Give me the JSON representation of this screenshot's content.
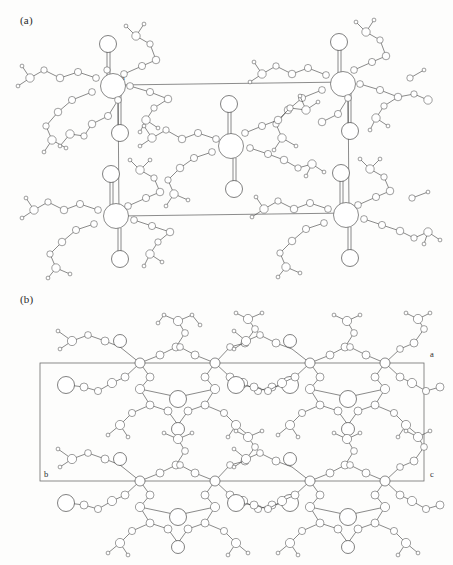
{
  "figure": {
    "type": "crystal-structure-packing-diagram",
    "background_color": "#fdfdfc",
    "line_color": "#2b2b2b",
    "cell_edge_color": "#6e6e6e",
    "atom_fill_color": "#ffffff"
  },
  "panels": [
    {
      "id": "a",
      "label": "(a)",
      "view_description": "Unit cell packing projection showing metal-centred coordination clusters with peripheral ligand groups",
      "unit_cell": {
        "shape": "parallelogram",
        "axis_labels": [
          {
            "name": "a",
            "text": "a",
            "corner": "top-left"
          },
          {
            "name": "b",
            "text": "b",
            "corner": "bottom-left"
          },
          {
            "name": "c",
            "text": "c",
            "corner": "bottom-right"
          }
        ]
      },
      "molecule_count": 5,
      "cluster_positions": [
        "top-left",
        "top-right",
        "centre",
        "bottom-left",
        "bottom-right"
      ]
    },
    {
      "id": "b",
      "label": "(b)",
      "view_description": "Orthogonal projection of the same packing viewed down a second axis, showing layered molecular sheets",
      "unit_cell": {
        "shape": "rectangle",
        "axis_labels": [
          {
            "name": "a",
            "text": "a",
            "corner": "top-right-outside"
          },
          {
            "name": "b",
            "text": "b",
            "corner": "bottom-left-inside"
          },
          {
            "name": "c",
            "text": "c",
            "corner": "bottom-right-outside"
          }
        ]
      },
      "molecule_count": 6,
      "cluster_positions": [
        "top-left",
        "top-right",
        "middle-left",
        "middle-right",
        "bottom-left",
        "bottom-right"
      ]
    }
  ],
  "atom_legend": [
    {
      "name": "large-circle",
      "role": "terminal oxygen / halide",
      "radius_px": 8
    },
    {
      "name": "medium-circle",
      "role": "metal centre / oxygen",
      "radius_px": 5
    },
    {
      "name": "small-circle",
      "role": "carbon",
      "radius_px": 3
    },
    {
      "name": "tiny-circle",
      "role": "hydrogen",
      "radius_px": 1.8
    }
  ]
}
